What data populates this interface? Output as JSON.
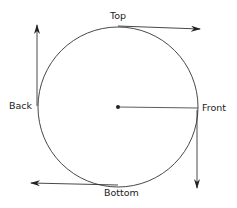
{
  "diagram": {
    "labels": {
      "top": "Top",
      "back": "Back",
      "front": "Front",
      "bottom": "Bottom"
    },
    "colors": {
      "stroke": "#333333",
      "background": "#ffffff"
    }
  }
}
